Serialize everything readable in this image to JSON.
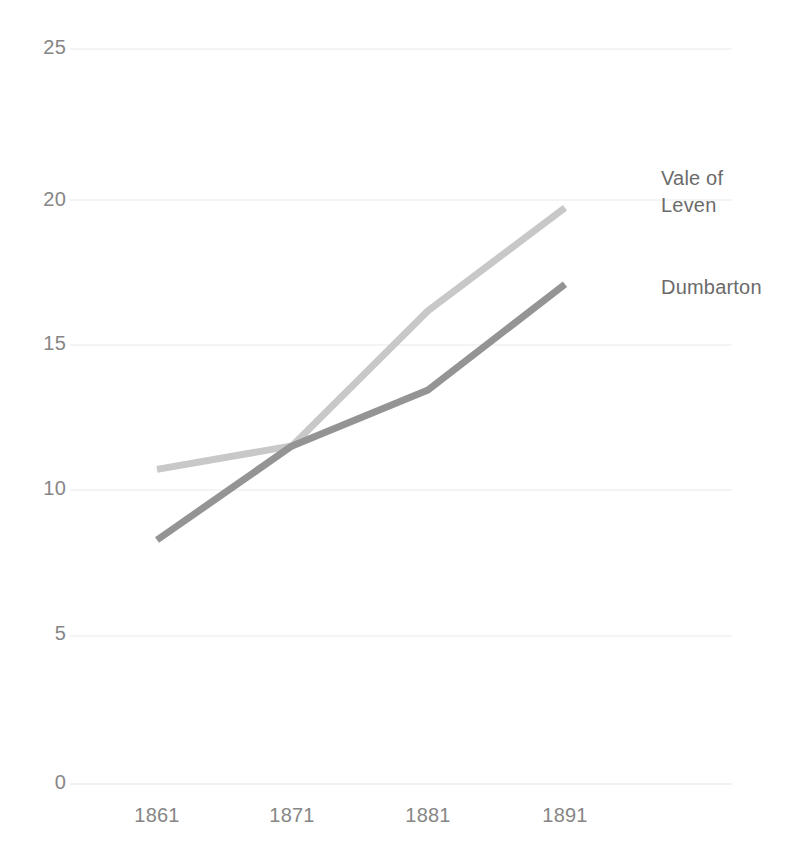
{
  "chart_data": {
    "type": "line",
    "title": "",
    "subtitle": "",
    "xlabel": "",
    "ylabel": "",
    "categories": [
      "1861",
      "1871",
      "1881",
      "1891"
    ],
    "x_tick_labels": [
      "1861",
      "1871",
      "1881",
      "1891"
    ],
    "y_tick_labels": [
      "0",
      "5",
      "10",
      "15",
      "20",
      "25"
    ],
    "y_tick_values": [
      0,
      5,
      10,
      15,
      20,
      25
    ],
    "ylim": [
      0,
      25
    ],
    "grid": "horizontal-only",
    "legend_position": "right-of-line-ends",
    "series": [
      {
        "name": "Vale of Leven",
        "label_text": "Vale of\nLeven",
        "color": "#c8c8c8",
        "values": [
          10.7,
          11.5,
          16.1,
          19.6
        ]
      },
      {
        "name": "Dumbarton",
        "label_text": "Dumbarton",
        "color": "#949494",
        "values": [
          8.3,
          11.5,
          13.4,
          17.0
        ]
      }
    ]
  },
  "axis": {
    "y_labels": [
      {
        "text": "25",
        "top": 36
      },
      {
        "text": "20",
        "top": 188
      },
      {
        "text": "15",
        "top": 332
      },
      {
        "text": "10",
        "top": 477
      },
      {
        "text": "5",
        "top": 622
      },
      {
        "text": "0",
        "top": 771
      }
    ],
    "x_labels": [
      {
        "text": "1861",
        "left": 102
      },
      {
        "text": "1871",
        "left": 237
      },
      {
        "text": "1881",
        "left": 373
      },
      {
        "text": "1891",
        "left": 510
      }
    ]
  },
  "series_labels": [
    {
      "text": "Vale of\nLeven",
      "left": 661,
      "top": 165,
      "name": "vale-of-leven"
    },
    {
      "text": "Dumbarton",
      "left": 661,
      "top": 274,
      "name": "dumbarton"
    }
  ],
  "colors": {
    "background": "#ffffff",
    "gridline": "#f0f0f0",
    "tick_text": "#868686",
    "label_text": "#6b6b6b",
    "series_light": "#c8c8c8",
    "series_dark": "#949494"
  }
}
